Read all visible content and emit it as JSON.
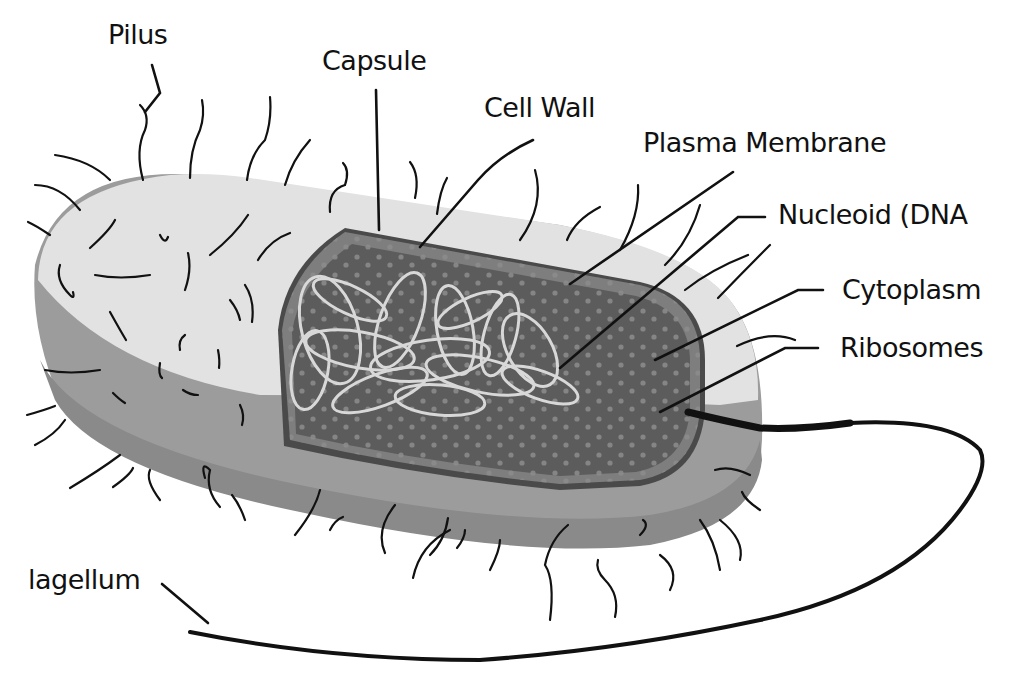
{
  "diagram": {
    "type": "labeled-illustration",
    "colors": {
      "background": "#ffffff",
      "capsule_top": "#e2e2e2",
      "capsule_side": "#9c9c9c",
      "capsule_side_dark": "#8a8a8a",
      "cell_wall": "#5a5a5a",
      "plasma_membrane": "#7e7e7e",
      "cytoplasm": "#5c5c5c",
      "ribosome_dots": "#8c8c8c",
      "nucleoid_strands": "#d8d8d8",
      "lines": "#111111"
    },
    "labels": [
      {
        "id": "pilus",
        "text": "Pilus"
      },
      {
        "id": "capsule",
        "text": "Capsule"
      },
      {
        "id": "cell-wall",
        "text": "Cell Wall"
      },
      {
        "id": "plasma-membrane",
        "text": "Plasma Membrane"
      },
      {
        "id": "nucleoid",
        "text": "Nucleoid (DNA"
      },
      {
        "id": "cytoplasm",
        "text": "Cytoplasm"
      },
      {
        "id": "ribosomes",
        "text": "Ribosomes"
      },
      {
        "id": "flagellum",
        "text": "lagellum"
      }
    ]
  }
}
